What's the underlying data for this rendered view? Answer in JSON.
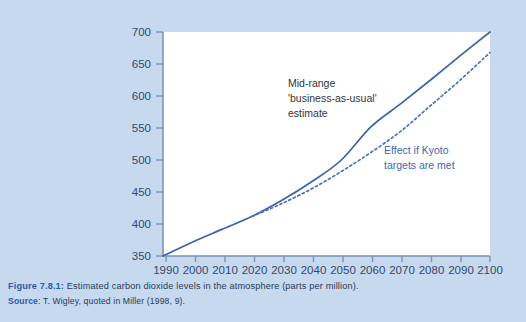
{
  "figure": {
    "caption_label": "Figure 7.8.1:",
    "caption_text": "Estimated carbon dioxide levels in the atmosphere (parts per million).",
    "source_label": "Source",
    "source_text": ": T. Wigley, quoted in Miller (1998, 9)."
  },
  "colors": {
    "background": "#c6d9ef",
    "plot_background": "#ffffff",
    "axis": "#7f93b5",
    "series_solid": "#3b63ab",
    "series_dashed": "#4a72bd",
    "tick_label": "#33496b",
    "annotation_dark": "#2f3542",
    "annotation_blue": "#3f66b5",
    "caption_accent": "#2d59a8",
    "caption_text": "#2b3a55"
  },
  "annotations": {
    "midrange": [
      "Mid-range",
      "'business-as-usual'",
      "estimate"
    ],
    "kyoto": [
      "Effect if Kyoto",
      "targets are met"
    ]
  },
  "chart_data": {
    "type": "line",
    "title": "Estimated carbon dioxide levels in the atmosphere (parts per million)",
    "xlabel": "",
    "ylabel": "",
    "xlim": [
      1990,
      2100
    ],
    "ylim": [
      350,
      700
    ],
    "grid": false,
    "legend": "annotations",
    "x_ticks": [
      1990,
      2000,
      2010,
      2020,
      2030,
      2040,
      2050,
      2060,
      2070,
      2080,
      2090,
      2100
    ],
    "y_ticks": [
      350,
      400,
      450,
      500,
      550,
      600,
      650,
      700
    ],
    "x": [
      1990,
      2000,
      2010,
      2020,
      2030,
      2040,
      2050,
      2060,
      2070,
      2080,
      2090,
      2100
    ],
    "series": [
      {
        "name": "Mid-range 'business-as-usual' estimate",
        "style": "solid",
        "color": "#3b63ab",
        "values": [
          350,
          372,
          392,
          412,
          437,
          466,
          500,
          552,
          588,
          625,
          663,
          700
        ]
      },
      {
        "name": "Effect if Kyoto targets are met",
        "style": "dashed",
        "color": "#4a72bd",
        "values": [
          null,
          null,
          null,
          412,
          432,
          455,
          482,
          512,
          545,
          585,
          625,
          668
        ]
      }
    ]
  }
}
